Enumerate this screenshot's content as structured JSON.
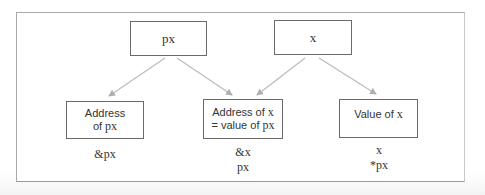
{
  "diagram": {
    "type": "pointer-relationship",
    "frame": {
      "border_color": "#a9a9a9"
    },
    "arrow_color": "#b5b5b5",
    "nodes": {
      "px": {
        "label": "px"
      },
      "x": {
        "label": "x"
      },
      "address_of_px": {
        "line1": "Address",
        "line2_prefix": "of ",
        "line2_code": "px"
      },
      "address_of_x": {
        "line1_prefix": "Address of ",
        "line1_code": "x",
        "line2_prefix": "= value of ",
        "line2_code": "px"
      },
      "value_of_x": {
        "line1_prefix": "Value of ",
        "line1_code": "x"
      }
    },
    "expressions": {
      "address_of_px": [
        "&px"
      ],
      "address_of_x": [
        "&x",
        "px"
      ],
      "value_of_x": [
        "x",
        "*px"
      ]
    },
    "edges": [
      {
        "from": "px",
        "to": "address_of_px"
      },
      {
        "from": "px",
        "to": "address_of_x"
      },
      {
        "from": "x",
        "to": "address_of_x"
      },
      {
        "from": "x",
        "to": "value_of_x"
      }
    ]
  }
}
